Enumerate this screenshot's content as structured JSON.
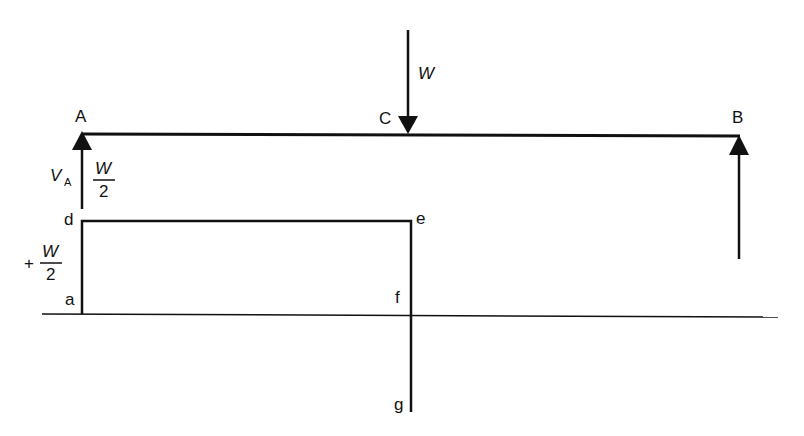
{
  "diagram": {
    "points": {
      "A": "A",
      "B": "B",
      "C": "C",
      "a": "a",
      "d": "d",
      "e": "e",
      "f": "f",
      "g": "g"
    },
    "load": {
      "label": "W"
    },
    "reaction_A": {
      "symbol": "V",
      "subscript": "A",
      "numerator": "W",
      "denominator": "2"
    },
    "shear_value": {
      "sign": "+",
      "numerator": "W",
      "denominator": "2"
    },
    "colors": {
      "ink": "#111111",
      "background": "#ffffff"
    }
  }
}
